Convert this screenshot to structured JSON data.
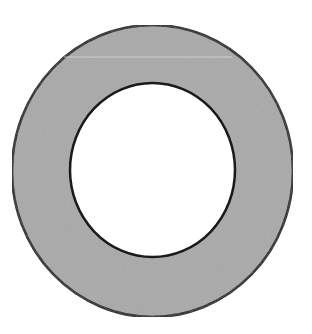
{
  "diagram": {
    "type": "annulus",
    "colors": {
      "background": "#ffffff",
      "ring_fill": "#a9a9a9",
      "stroke": "#1a1a1a",
      "hole_fill": "#ffffff"
    },
    "outer": {
      "cx": 152.5,
      "cy": 171,
      "rx": 140.5,
      "ry": 146
    },
    "inner": {
      "cx": 152.5,
      "cy": 170,
      "rx": 82.5,
      "ry": 87
    }
  }
}
